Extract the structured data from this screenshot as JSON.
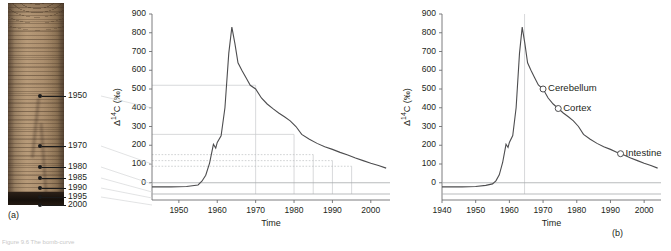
{
  "figure": {
    "panel_a": {
      "label": "(a)",
      "image_name": "tree-core-photo",
      "ring_year_labels": [
        "1950",
        "1970",
        "1980",
        "1985",
        "1990",
        "1995",
        "2000"
      ]
    },
    "panel_b": {
      "label": "(b)"
    },
    "caption": "Figure 9.6  The bomb-curve"
  },
  "chart_data": [
    {
      "id": "middle-chart",
      "type": "line",
      "title": "",
      "xlabel": "Time",
      "ylabel": "Δ¹⁴C (‰)",
      "xlim": [
        1943,
        2005
      ],
      "ylim": [
        -60,
        900
      ],
      "xticks": [
        1950,
        1960,
        1970,
        1980,
        1990,
        2000
      ],
      "xticklabels": [
        "1950",
        "1960",
        "1970",
        "1980",
        "1990",
        "2000"
      ],
      "yticks": [
        0,
        100,
        200,
        300,
        400,
        500,
        600,
        700,
        800,
        900
      ],
      "yticklabels": [
        "0",
        "100",
        "200",
        "300",
        "400",
        "500",
        "600",
        "700",
        "800",
        "900"
      ],
      "grid": false,
      "zero_reference": 0,
      "series": [
        {
          "name": "Atmospheric Δ14C",
          "x": [
            1943,
            1948,
            1952,
            1955,
            1956,
            1957,
            1958,
            1959,
            1959.6,
            1960,
            1961,
            1962,
            1963,
            1963.8,
            1964.6,
            1965.4,
            1966.4,
            1967.5,
            1968.6,
            1970,
            1971.5,
            1973,
            1974.5,
            1976,
            1977.5,
            1979,
            1980.5,
            1982,
            1984,
            1986,
            1988,
            1990,
            1992,
            1994,
            1996,
            1998,
            2000,
            2002,
            2004
          ],
          "y": [
            -22,
            -22,
            -20,
            -12,
            8,
            40,
            105,
            205,
            185,
            215,
            250,
            400,
            690,
            830,
            742,
            640,
            600,
            560,
            520,
            500,
            452,
            420,
            395,
            372,
            352,
            330,
            300,
            258,
            232,
            210,
            192,
            178,
            162,
            148,
            132,
            118,
            104,
            92,
            78
          ]
        }
      ],
      "guide_levels": [
        520,
        258,
        150,
        118,
        88
      ],
      "guide_drop_years": [
        1970,
        1980,
        1985,
        1990,
        1995
      ]
    },
    {
      "id": "right-chart",
      "type": "line",
      "title": "",
      "xlabel": "Time",
      "ylabel": "Δ¹⁴C (‰)",
      "xlim": [
        1940,
        2005
      ],
      "ylim": [
        -60,
        900
      ],
      "xticks": [
        1940,
        1950,
        1960,
        1970,
        1980,
        1990,
        2000
      ],
      "xticklabels": [
        "1940",
        "1950",
        "1960",
        "1970",
        "1980",
        "1990",
        "2000"
      ],
      "yticks": [
        0,
        100,
        200,
        300,
        400,
        500,
        600,
        700,
        800,
        900
      ],
      "yticklabels": [
        "0",
        "100",
        "200",
        "300",
        "400",
        "500",
        "600",
        "700",
        "800",
        "900"
      ],
      "grid": false,
      "zero_reference": 0,
      "peak_marker_year": 1964.5,
      "series": [
        {
          "name": "Atmospheric Δ14C",
          "x": [
            1940,
            1946,
            1950,
            1953,
            1955,
            1956,
            1957,
            1958,
            1959,
            1959.6,
            1960,
            1961,
            1962,
            1963,
            1963.8,
            1964.6,
            1965.4,
            1966.4,
            1967.5,
            1968.6,
            1970,
            1971.5,
            1973,
            1974.5,
            1976,
            1977.5,
            1979,
            1980.5,
            1982,
            1984,
            1986,
            1988,
            1990,
            1992,
            1994,
            1996,
            1998,
            2000,
            2002,
            2004
          ],
          "y": [
            -22,
            -22,
            -20,
            -14,
            -6,
            10,
            42,
            108,
            205,
            188,
            215,
            252,
            400,
            690,
            830,
            742,
            640,
            600,
            560,
            522,
            500,
            452,
            420,
            396,
            372,
            352,
            330,
            300,
            258,
            232,
            210,
            192,
            178,
            162,
            148,
            132,
            118,
            104,
            92,
            78
          ]
        }
      ],
      "annotations": [
        {
          "label": "Cerebellum",
          "x": 1970,
          "y": 500
        },
        {
          "label": "Cortex",
          "x": 1974.5,
          "y": 396
        },
        {
          "label": "Intestine",
          "x": 1993,
          "y": 155
        }
      ]
    }
  ]
}
